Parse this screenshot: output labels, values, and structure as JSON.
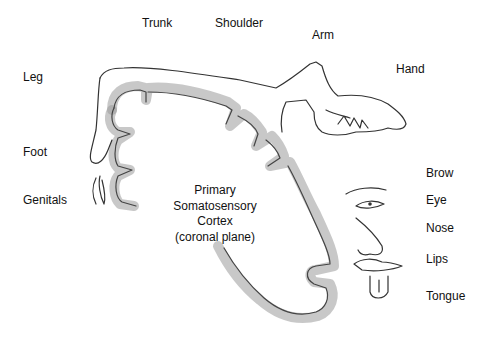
{
  "diagram": {
    "title_lines": [
      "Primary",
      "Somatosensory",
      "Cortex",
      "(coronal plane)"
    ],
    "labels": {
      "trunk": "Trunk",
      "shoulder": "Shoulder",
      "arm": "Arm",
      "hand": "Hand",
      "leg": "Leg",
      "foot": "Foot",
      "genitals": "Genitals",
      "brow": "Brow",
      "eye": "Eye",
      "nose": "Nose",
      "lips": "Lips",
      "tongue": "Tongue"
    },
    "style": "hand-drawn pencil sketch of sensory homunculus over cortex",
    "colors": {
      "background": "#ffffff",
      "pencil": "#555555",
      "text": "#111111"
    }
  }
}
